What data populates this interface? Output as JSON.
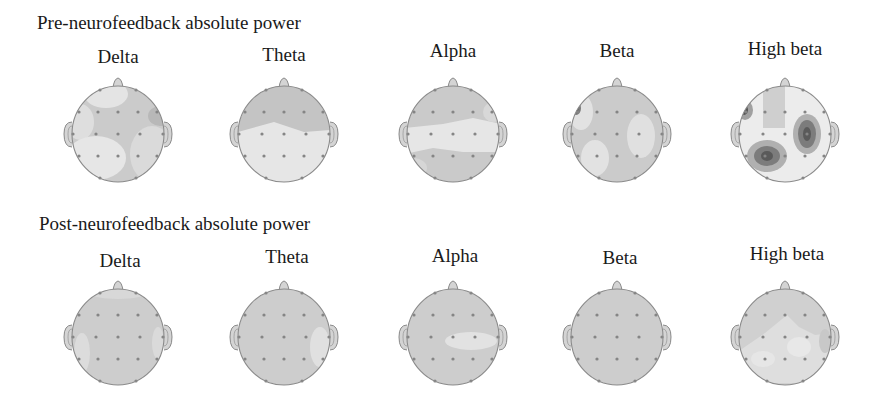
{
  "chart_data": {
    "type": "heatmap",
    "subtype": "eeg-topographic-maps",
    "title": "",
    "rows": [
      {
        "label": "Pre-neurofeedback absolute power",
        "maps": [
          {
            "band": "Delta",
            "description": "mostly mid-gray; light patches front-left, front-center, left-posterior and right-posterior; slightly darker right-frontal"
          },
          {
            "band": "Theta",
            "description": "darker band across frontal region; light posterior half"
          },
          {
            "band": "Alpha",
            "description": "darker frontal and occipital; light horizontal band across central region"
          },
          {
            "band": "Beta",
            "description": "mid-gray; small dark focus at left-frontal edge; light patches right-central and left-posterior"
          },
          {
            "band": "High beta",
            "description": "light background; three dark foci at left-frontal, right-central and left-posterior; mid-gray frontal-central strip"
          }
        ]
      },
      {
        "label": "Post-neurofeedback absolute power",
        "maps": [
          {
            "band": "Delta",
            "description": "nearly uniform mid-gray; slightly lighter edges"
          },
          {
            "band": "Theta",
            "description": "uniform mid-gray; light patch right-temporal"
          },
          {
            "band": "Alpha",
            "description": "uniform mid-gray; light patch right-central"
          },
          {
            "band": "Beta",
            "description": "uniform mid-gray"
          },
          {
            "band": "High beta",
            "description": "mid-gray frontal; lighter central and posterior regions"
          }
        ]
      }
    ],
    "colors": {
      "low": "#e8e8e8",
      "mid": "#c8c8c8",
      "high": "#8c8c8c",
      "peak": "#5a5a5a"
    },
    "legend": "none",
    "grid": false
  },
  "page": {
    "pre_title": "Pre-neurofeedback absolute power",
    "post_title": "Post-neurofeedback absolute power",
    "bands": [
      "Delta",
      "Theta",
      "Alpha",
      "Beta",
      "High beta"
    ]
  },
  "layout": {
    "cols": [
      118,
      284,
      453,
      617,
      785
    ],
    "pre_cy": 134,
    "post_cy": 337,
    "rx": 46,
    "ry": 48
  },
  "maps": {
    "pre": [
      {
        "base": "#cbcbcb",
        "blobs": [
          {
            "type": "ellipse",
            "cx": -12,
            "cy": -40,
            "rx": 22,
            "ry": 14,
            "fill": "#e4e4e4"
          },
          {
            "type": "ellipse",
            "cx": -38,
            "cy": -12,
            "rx": 14,
            "ry": 18,
            "fill": "#dedede"
          },
          {
            "type": "ellipse",
            "cx": -22,
            "cy": 24,
            "rx": 30,
            "ry": 22,
            "fill": "#e6e6e6"
          },
          {
            "type": "ellipse",
            "cx": 34,
            "cy": 20,
            "rx": 22,
            "ry": 28,
            "fill": "#dadada"
          },
          {
            "type": "ellipse",
            "cx": 42,
            "cy": -18,
            "rx": 12,
            "ry": 10,
            "fill": "#b8b8b8"
          }
        ]
      },
      {
        "base": "#e6e6e6",
        "blobs": [
          {
            "type": "polygon",
            "points": "-46,-10 -30,-44 0,-50 30,-44 46,-10 46,-4 20,-2 -10,-12 -46,-2",
            "fill": "#c4c4c4"
          }
        ]
      },
      {
        "base": "#cacaca",
        "blobs": [
          {
            "type": "polygon",
            "points": "-48,-6 -10,-10 20,-16 48,-10 48,18 10,18 -20,14 -48,20",
            "fill": "#e6e6e6"
          },
          {
            "type": "ellipse",
            "cx": 40,
            "cy": -22,
            "rx": 10,
            "ry": 10,
            "fill": "#d8d8d8"
          },
          {
            "type": "ellipse",
            "cx": -40,
            "cy": 34,
            "rx": 14,
            "ry": 10,
            "fill": "#d6d6d6"
          }
        ]
      },
      {
        "base": "#cbcbcb",
        "blobs": [
          {
            "type": "ellipse",
            "cx": -36,
            "cy": -22,
            "rx": 12,
            "ry": 18,
            "fill": "#e2e2e2"
          },
          {
            "type": "ellipse",
            "cx": -41,
            "cy": -26,
            "rx": 5,
            "ry": 7,
            "fill": "#7a7a7a"
          },
          {
            "type": "ellipse",
            "cx": -41,
            "cy": -26,
            "rx": 2.5,
            "ry": 3.5,
            "fill": "#555555"
          },
          {
            "type": "ellipse",
            "cx": 24,
            "cy": 2,
            "rx": 14,
            "ry": 22,
            "fill": "#e0e0e0"
          },
          {
            "type": "ellipse",
            "cx": -22,
            "cy": 24,
            "rx": 14,
            "ry": 18,
            "fill": "#e2e2e2"
          }
        ]
      },
      {
        "base": "#ececec",
        "blobs": [
          {
            "type": "rect",
            "x": -22,
            "y": -50,
            "w": 22,
            "h": 44,
            "fill": "#cfcfcf"
          },
          {
            "type": "ellipse",
            "cx": -40,
            "cy": -24,
            "rx": 8,
            "ry": 10,
            "fill": "#a0a0a0"
          },
          {
            "type": "ellipse",
            "cx": -41,
            "cy": -24,
            "rx": 4,
            "ry": 5,
            "fill": "#555555"
          },
          {
            "type": "ellipse",
            "cx": 22,
            "cy": 0,
            "rx": 14,
            "ry": 20,
            "fill": "#b0b0b0"
          },
          {
            "type": "ellipse",
            "cx": 22,
            "cy": 0,
            "rx": 9,
            "ry": 14,
            "fill": "#7c7c7c"
          },
          {
            "type": "ellipse",
            "cx": 22,
            "cy": 0,
            "rx": 4,
            "ry": 7,
            "fill": "#5a5a5a"
          },
          {
            "type": "ellipse",
            "cx": -18,
            "cy": 22,
            "rx": 20,
            "ry": 16,
            "fill": "#b0b0b0"
          },
          {
            "type": "ellipse",
            "cx": -18,
            "cy": 22,
            "rx": 13,
            "ry": 10,
            "fill": "#7c7c7c"
          },
          {
            "type": "ellipse",
            "cx": -18,
            "cy": 22,
            "rx": 6,
            "ry": 5,
            "fill": "#5a5a5a"
          }
        ]
      }
    ],
    "post": [
      {
        "base": "#cdcdcd",
        "blobs": [
          {
            "type": "ellipse",
            "cx": -36,
            "cy": 16,
            "rx": 8,
            "ry": 20,
            "fill": "#dcdcdc"
          },
          {
            "type": "ellipse",
            "cx": 40,
            "cy": 6,
            "rx": 6,
            "ry": 16,
            "fill": "#dadada"
          },
          {
            "type": "ellipse",
            "cx": 0,
            "cy": -44,
            "rx": 28,
            "ry": 6,
            "fill": "#d8d8d8"
          }
        ]
      },
      {
        "base": "#cdcdcd",
        "blobs": [
          {
            "type": "ellipse",
            "cx": 36,
            "cy": 10,
            "rx": 10,
            "ry": 20,
            "fill": "#e0e0e0"
          }
        ]
      },
      {
        "base": "#cdcdcd",
        "blobs": [
          {
            "type": "ellipse",
            "cx": 18,
            "cy": 4,
            "rx": 26,
            "ry": 9,
            "fill": "#e2e2e2"
          }
        ]
      },
      {
        "base": "#cdcdcd",
        "blobs": []
      },
      {
        "base": "#d0d0d0",
        "blobs": [
          {
            "type": "polygon",
            "points": "-46,14 -20,-4 2,-22 14,-10 30,-2 46,-4 46,30 20,46 -20,46 -46,30",
            "fill": "#dedede"
          },
          {
            "type": "ellipse",
            "cx": 14,
            "cy": 10,
            "rx": 12,
            "ry": 10,
            "fill": "#e8e8e8"
          },
          {
            "type": "ellipse",
            "cx": -22,
            "cy": 22,
            "rx": 12,
            "ry": 8,
            "fill": "#e6e6e6"
          },
          {
            "type": "ellipse",
            "cx": 40,
            "cy": 4,
            "rx": 6,
            "ry": 12,
            "fill": "#c8c8c8"
          }
        ]
      }
    ]
  },
  "electrodes": [
    [
      -18,
      -44
    ],
    [
      18,
      -44
    ],
    [
      -39,
      -22
    ],
    [
      -20,
      -22
    ],
    [
      0,
      -22
    ],
    [
      20,
      -22
    ],
    [
      39,
      -22
    ],
    [
      -45,
      0
    ],
    [
      -22,
      0
    ],
    [
      0,
      0
    ],
    [
      22,
      0
    ],
    [
      45,
      0
    ],
    [
      -39,
      22
    ],
    [
      -20,
      22
    ],
    [
      0,
      22
    ],
    [
      20,
      22
    ],
    [
      39,
      22
    ],
    [
      -18,
      44
    ],
    [
      18,
      44
    ]
  ]
}
